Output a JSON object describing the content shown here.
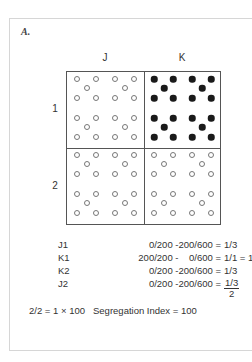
{
  "panel": {
    "label": "A."
  },
  "grid": {
    "columns": [
      {
        "label": "J"
      },
      {
        "label": "K"
      }
    ],
    "rows": [
      {
        "label": "1"
      },
      {
        "label": "2"
      }
    ],
    "cells": [
      {
        "id": "J1",
        "dot_type": "open",
        "count": 20
      },
      {
        "id": "K1",
        "dot_type": "filled",
        "count": 20
      },
      {
        "id": "J2",
        "dot_type": "open",
        "count": 20
      },
      {
        "id": "K2",
        "dot_type": "open",
        "count": 20
      }
    ],
    "colors": {
      "border": "#555555",
      "open_dot": "#777777",
      "filled_dot": "#1a1a1a"
    }
  },
  "calculations": [
    {
      "label": "J1",
      "expression": "0/200 -200/600 =",
      "result": "1/3"
    },
    {
      "label": "K1",
      "expression": "200/200 -    0/600 =",
      "result": "1/1 = 1"
    },
    {
      "label": "K2",
      "expression": "0/200 -200/600 =",
      "result": "1/3"
    },
    {
      "label": "J2",
      "expression": "0/200 -200/600 =",
      "result_numerator": "1/3",
      "result_denominator": "2"
    }
  ],
  "summary": {
    "formula": "2/2 = 1 × 100",
    "index_label": "Segregation Index = 100"
  }
}
